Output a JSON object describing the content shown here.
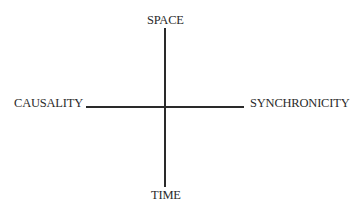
{
  "diagram": {
    "axes": {
      "top": "SPACE",
      "bottom": "TIME",
      "left": "CAUSALITY",
      "right": "SYNCHRONICITY"
    },
    "line_color": "#2a2a2a"
  }
}
